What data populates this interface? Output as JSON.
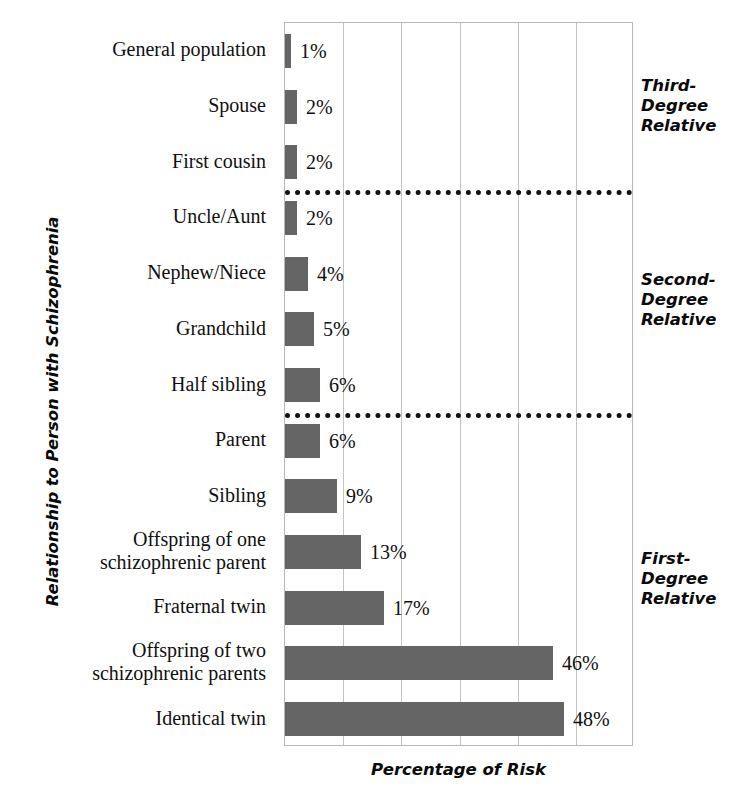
{
  "chart_data": {
    "type": "bar",
    "orientation": "horizontal",
    "title": "",
    "xlabel": "Percentage of Risk",
    "ylabel": "Relationship to Person with Schizophrenia",
    "xlim": [
      0,
      60
    ],
    "xticks": [
      0,
      10,
      20,
      30,
      40,
      50,
      60
    ],
    "xtick_labels": [
      "",
      "",
      "",
      "",
      "",
      "",
      ""
    ],
    "grid": true,
    "legend": false,
    "bar_color": "#656565",
    "categories": [
      "General population",
      "Spouse",
      "First cousin",
      "Uncle/Aunt",
      "Nephew/Niece",
      "Grandchild",
      "Half sibling",
      "Parent",
      "Sibling",
      "Offspring of one\nschizophrenic parent",
      "Fraternal twin",
      "Offspring of two\nschizophrenic parents",
      "Identical twin"
    ],
    "values": [
      1,
      2,
      2,
      2,
      4,
      5,
      6,
      6,
      9,
      13,
      17,
      46,
      48
    ],
    "value_labels": [
      "1%",
      "2%",
      "2%",
      "2%",
      "4%",
      "5%",
      "6%",
      "6%",
      "9%",
      "13%",
      "17%",
      "46%",
      "48%"
    ],
    "group_annotations": [
      {
        "label": "Third-\nDegree\nRelative",
        "members": [
          "General population",
          "Spouse",
          "First cousin"
        ]
      },
      {
        "label": "Second-\nDegree\nRelative",
        "members": [
          "Uncle/Aunt",
          "Nephew/Niece",
          "Grandchild",
          "Half sibling"
        ]
      },
      {
        "label": "First-\nDegree\nRelative",
        "members": [
          "Parent",
          "Sibling",
          "Offspring of one schizophrenic parent",
          "Fraternal twin",
          "Offspring of two schizophrenic parents",
          "Identical twin"
        ]
      }
    ],
    "group_separators": [
      {
        "after_category": "First cousin",
        "style": "dotted"
      },
      {
        "after_category": "Half sibling",
        "style": "dotted"
      }
    ]
  }
}
